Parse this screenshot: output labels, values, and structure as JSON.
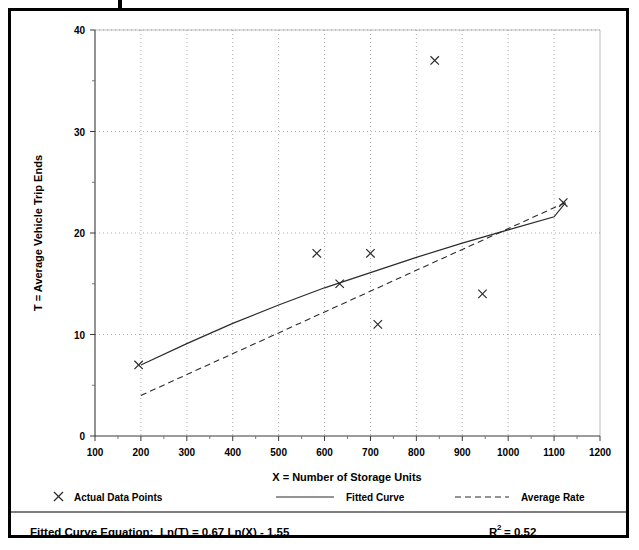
{
  "chart_data": {
    "type": "scatter",
    "title": "",
    "xlabel": "X = Number of Storage Units",
    "ylabel": "T = Average Vehicle Trip Ends",
    "xlim": [
      100,
      1200
    ],
    "ylim": [
      0,
      40
    ],
    "grid": true,
    "x_ticks": [
      100,
      200,
      300,
      400,
      500,
      600,
      700,
      800,
      900,
      1000,
      1100,
      1200
    ],
    "x_tick_labels": [
      "100",
      "200",
      "300",
      "400",
      "500",
      "600",
      "700",
      "800",
      "900",
      "1000",
      "1100",
      "1200"
    ],
    "y_ticks": [
      0,
      10,
      20,
      30,
      40
    ],
    "y_tick_labels": [
      "0",
      "10",
      "20",
      "30",
      "40"
    ],
    "series": [
      {
        "name": "Actual Data Points",
        "type": "scatter",
        "marker": "x",
        "points": [
          {
            "x": 195,
            "y": 7
          },
          {
            "x": 583,
            "y": 18
          },
          {
            "x": 633,
            "y": 15
          },
          {
            "x": 700,
            "y": 18
          },
          {
            "x": 716,
            "y": 11
          },
          {
            "x": 840,
            "y": 37
          },
          {
            "x": 944,
            "y": 14
          },
          {
            "x": 1120,
            "y": 23
          }
        ]
      },
      {
        "name": "Fitted Curve",
        "type": "line",
        "style": "solid",
        "points": [
          {
            "x": 200,
            "y": 7.0
          },
          {
            "x": 300,
            "y": 9.1
          },
          {
            "x": 400,
            "y": 11.1
          },
          {
            "x": 500,
            "y": 12.9
          },
          {
            "x": 600,
            "y": 14.6
          },
          {
            "x": 700,
            "y": 16.1
          },
          {
            "x": 800,
            "y": 17.6
          },
          {
            "x": 900,
            "y": 19.0
          },
          {
            "x": 1000,
            "y": 20.3
          },
          {
            "x": 1100,
            "y": 21.6
          },
          {
            "x": 1125,
            "y": 23.0
          }
        ]
      },
      {
        "name": "Average Rate",
        "type": "line",
        "style": "dashed",
        "points": [
          {
            "x": 200,
            "y": 4.0
          },
          {
            "x": 1125,
            "y": 23.0
          }
        ]
      }
    ]
  },
  "legend": {
    "position": "below-axis",
    "entries": [
      {
        "label": "Actual Data Points",
        "symbol": "x-marker"
      },
      {
        "label": "Fitted Curve",
        "symbol": "solid-line"
      },
      {
        "label": "Average Rate",
        "symbol": "dashed-line"
      }
    ]
  },
  "footer": {
    "equation_label": "Fitted Curve Equation:",
    "equation": "Ln(T) = 0.67 Ln(X) - 1.55",
    "r_squared_base": "R",
    "r_squared_exp": "2",
    "r_squared_value": "= 0.52"
  },
  "colors": {
    "ink": "#000000",
    "line": "#2b2b2b",
    "grid": "#9a9a9a",
    "axis": "#3a3a3a",
    "background": "#ffffff"
  }
}
